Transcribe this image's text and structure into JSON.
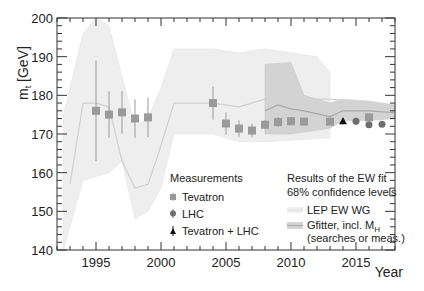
{
  "chart_data": {
    "type": "scatter",
    "title": "",
    "xlabel": "Year",
    "ylabel": "m_t [GeV]",
    "xlim": [
      1992,
      2018
    ],
    "ylim": [
      140,
      200
    ],
    "x_ticks": [
      1995,
      2000,
      2005,
      2010,
      2015
    ],
    "y_ticks": [
      140,
      150,
      160,
      170,
      180,
      190,
      200
    ],
    "grid": false,
    "legend_position": "lower center/right (inside)",
    "series": [
      {
        "name": "Tevatron",
        "marker": "square",
        "color": "#9a9a9a",
        "points": [
          {
            "x": 1995,
            "y": 176,
            "err": 13
          },
          {
            "x": 1996,
            "y": 175,
            "err": 6
          },
          {
            "x": 1997,
            "y": 175.6,
            "err": 5.5
          },
          {
            "x": 1998,
            "y": 174,
            "err": 5
          },
          {
            "x": 1999,
            "y": 174.3,
            "err": 5.1
          },
          {
            "x": 2004,
            "y": 178,
            "err": 4.3
          },
          {
            "x": 2005,
            "y": 172.7,
            "err": 2.9
          },
          {
            "x": 2006,
            "y": 171.4,
            "err": 2.1
          },
          {
            "x": 2007,
            "y": 170.9,
            "err": 1.8
          },
          {
            "x": 2008,
            "y": 172.4,
            "err": 1.2
          },
          {
            "x": 2009,
            "y": 173.1,
            "err": 1.3
          },
          {
            "x": 2010,
            "y": 173.3,
            "err": 1.1
          },
          {
            "x": 2011,
            "y": 173.2,
            "err": 0.9
          },
          {
            "x": 2013,
            "y": 173.2,
            "err": 0.9
          },
          {
            "x": 2016,
            "y": 174.3,
            "err": 0.6
          }
        ]
      },
      {
        "name": "LHC",
        "marker": "circle",
        "color": "#6e6e6e",
        "points": [
          {
            "x": 2015,
            "y": 173.3,
            "err": 0.9
          },
          {
            "x": 2016,
            "y": 172.4,
            "err": 0.5
          },
          {
            "x": 2017,
            "y": 172.5,
            "err": 0.5
          }
        ]
      },
      {
        "name": "Tevatron + LHC",
        "marker": "triangle",
        "color": "#111111",
        "points": [
          {
            "x": 2014,
            "y": 173.3,
            "err": 0.8
          }
        ]
      }
    ],
    "bands": [
      {
        "name": "LEP EW WG",
        "color": "#eeeeee",
        "center": [
          [
            1993,
            157
          ],
          [
            1994,
            178
          ],
          [
            1995,
            178
          ],
          [
            1996,
            177
          ],
          [
            1997,
            163
          ],
          [
            1998,
            156
          ],
          [
            1999,
            157
          ],
          [
            2000,
            167
          ],
          [
            2001,
            178
          ],
          [
            2004,
            178
          ],
          [
            2006,
            177
          ],
          [
            2008,
            179
          ],
          [
            2010,
            179
          ],
          [
            2013,
            179
          ],
          [
            2016,
            178
          ],
          [
            2018,
            177
          ]
        ],
        "upper": [
          [
            1992.5,
            175
          ],
          [
            1994,
            196
          ],
          [
            1995,
            200
          ],
          [
            1996,
            198
          ],
          [
            1997,
            185
          ],
          [
            1998,
            172
          ],
          [
            1999,
            174
          ],
          [
            2000,
            182
          ],
          [
            2001,
            192
          ],
          [
            2004,
            192
          ],
          [
            2006,
            191
          ],
          [
            2008,
            192
          ],
          [
            2012,
            190
          ],
          [
            2013,
            186
          ]
        ],
        "lower": [
          [
            1992.5,
            140
          ],
          [
            1994,
            158
          ],
          [
            1995,
            159
          ],
          [
            1996,
            160
          ],
          [
            1997,
            163
          ],
          [
            1998,
            148
          ],
          [
            1999,
            150
          ],
          [
            2000,
            156
          ],
          [
            2001,
            170
          ],
          [
            2004,
            170
          ],
          [
            2006,
            168
          ],
          [
            2008,
            168
          ],
          [
            2013,
            169
          ]
        ]
      },
      {
        "name": "Gfitter, incl. M_H (searches or meas.)",
        "color": "#d3d3d3",
        "center": [
          [
            2008,
            176
          ],
          [
            2009,
            177.5
          ],
          [
            2010,
            176.5
          ],
          [
            2011,
            176
          ],
          [
            2013,
            174.5
          ],
          [
            2014,
            176
          ],
          [
            2016,
            176
          ],
          [
            2018,
            175.5
          ]
        ],
        "upper": [
          [
            2008,
            188
          ],
          [
            2010,
            188.5
          ],
          [
            2011,
            180
          ],
          [
            2013,
            178
          ],
          [
            2014,
            179
          ],
          [
            2016,
            178.5
          ],
          [
            2018,
            177.5
          ]
        ],
        "lower": [
          [
            2008,
            170
          ],
          [
            2010,
            170
          ],
          [
            2011,
            170.5
          ],
          [
            2013,
            171.5
          ],
          [
            2014,
            173.5
          ],
          [
            2016,
            173.5
          ],
          [
            2018,
            174
          ]
        ]
      }
    ]
  },
  "axes": {
    "ylabel_main": "m",
    "ylabel_sub": "t",
    "ylabel_unit": " [GeV]",
    "xlabel": "Year",
    "x_tick_labels": [
      "1995",
      "2000",
      "2005",
      "2010",
      "2015"
    ],
    "y_tick_labels": [
      "140",
      "150",
      "160",
      "170",
      "180",
      "190",
      "200"
    ]
  },
  "legend_measurements": {
    "title": "Measurements",
    "items": [
      "Tevatron",
      "LHC",
      "Tevatron + LHC"
    ]
  },
  "legend_fit": {
    "title_line1": "Results of the EW fit",
    "title_line2": "68% confidence levels",
    "lep": "LEP EW WG",
    "gfitter_line1": "Gfitter, incl. M",
    "gfitter_sub": "H",
    "gfitter_line2": "(searches or meas.)"
  }
}
